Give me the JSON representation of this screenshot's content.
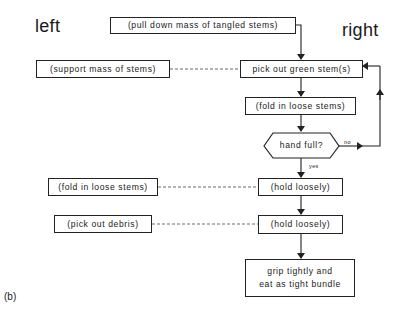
{
  "headers": {
    "left": "left",
    "right": "right"
  },
  "figure_label": "(b)",
  "nodes": {
    "pull_down": "(pull down mass of tangled stems)",
    "pick_green": "pick out green stem(s)",
    "support_mass": "(support mass of stems)",
    "fold_right": "(fold in loose stems)",
    "decision": "hand full?",
    "fold_left": "(fold in loose stems)",
    "hold1": "(hold loosely)",
    "pick_debris": "(pick out debris)",
    "hold2": "(hold loosely)",
    "grip_line1": "grip tightly and",
    "grip_line2": "eat as tight bundle"
  },
  "edge_labels": {
    "no": "no",
    "yes": "yes"
  },
  "colors": {
    "line": "#222222",
    "background": "#ffffff"
  }
}
